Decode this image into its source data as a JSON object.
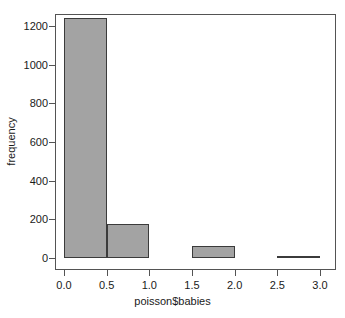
{
  "chart_data": {
    "type": "bar",
    "title": "",
    "subtitle": "",
    "xlabel": "poisson$babies",
    "ylabel": "frequency",
    "xlim": [
      -0.1,
      3.1
    ],
    "ylim": [
      0,
      1300
    ],
    "grid": false,
    "legend": null,
    "bin_width": 0.5,
    "bin_edges": [
      0.0,
      0.5,
      1.0,
      1.5,
      2.0,
      2.5,
      3.0
    ],
    "categories": [
      "0.0-0.5",
      "0.5-1.0",
      "1.0-1.5",
      "1.5-2.0",
      "2.0-2.5",
      "2.5-3.0"
    ],
    "values": [
      1240,
      178,
      0,
      62,
      0,
      5
    ],
    "bars": [
      {
        "x0": 0.0,
        "x1": 0.5,
        "value": 1240
      },
      {
        "x0": 0.5,
        "x1": 1.0,
        "value": 178
      },
      {
        "x0": 1.0,
        "x1": 1.5,
        "value": 0
      },
      {
        "x0": 1.5,
        "x1": 2.0,
        "value": 62
      },
      {
        "x0": 2.0,
        "x1": 2.5,
        "value": 0
      },
      {
        "x0": 2.5,
        "x1": 3.0,
        "value": 5
      }
    ],
    "x_ticks": [
      0.0,
      0.5,
      1.0,
      1.5,
      2.0,
      2.5,
      3.0
    ],
    "x_tick_labels": [
      "0.0",
      "0.5",
      "1.0",
      "1.5",
      "2.0",
      "2.5",
      "3.0"
    ],
    "y_ticks": [
      0,
      200,
      400,
      600,
      800,
      1000,
      1200
    ],
    "y_tick_labels": [
      "0",
      "200",
      "400",
      "600",
      "800",
      "1000",
      "1200"
    ],
    "colors": {
      "bar_fill": "#a3a3a3",
      "bar_border": "#3b3b3b",
      "axis": "#545454",
      "text": "#1a1a1a",
      "background": "#ffffff"
    }
  }
}
